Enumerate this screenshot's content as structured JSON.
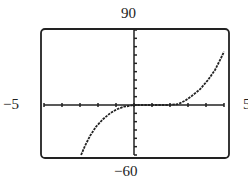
{
  "chart_data": {
    "type": "line",
    "title": "",
    "xlabel": "",
    "ylabel": "",
    "xlim": [
      -5,
      5
    ],
    "ylim": [
      -60,
      90
    ],
    "x_tick_step": 1,
    "y_tick_step": 10,
    "grid": false,
    "legend": null,
    "window_labels": {
      "ymax": "90",
      "ymin": "−60",
      "xmin": "−5",
      "xmax": "5"
    },
    "series": [
      {
        "name": "curve",
        "style": "dotted",
        "x": [
          -2.94,
          -2.72,
          -2.44,
          -2.11,
          -1.72,
          -1.33,
          -0.94,
          -0.56,
          -0.22,
          0,
          0.5,
          1.0,
          1.5,
          1.89,
          2.44,
          2.83,
          3.22,
          3.67,
          4.11,
          4.5,
          4.83,
          5.0
        ],
        "y": [
          -60,
          -49,
          -37,
          -26,
          -17,
          -10,
          -5,
          -2,
          -1,
          0,
          0,
          0,
          0,
          0,
          1,
          5,
          11,
          19,
          30,
          42,
          56,
          64
        ]
      }
    ]
  },
  "labels": {
    "top": "90",
    "bottom": "−60",
    "left": "−5",
    "right": "5"
  }
}
